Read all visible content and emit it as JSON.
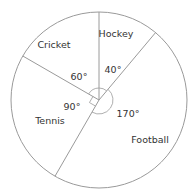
{
  "chart_data": {
    "type": "pie",
    "title": "",
    "unit": "degrees",
    "start_angle_deg": 0,
    "direction": "clockwise",
    "categories": [
      "Hockey",
      "Football",
      "Tennis",
      "Cricket"
    ],
    "values": [
      40,
      170,
      90,
      60
    ],
    "angle_labels": [
      "40°",
      "170°",
      "90°",
      "60°"
    ],
    "legend": "none",
    "colors": {
      "stroke": "#9a9a9a",
      "fill": "#ffffff",
      "text": "#333333"
    }
  }
}
